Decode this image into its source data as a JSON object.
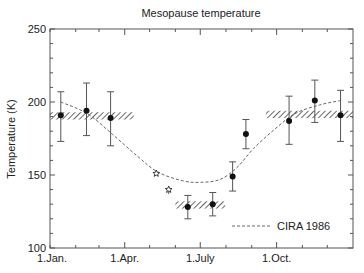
{
  "chart_data": {
    "type": "scatter",
    "title": "Mesopause temperature",
    "xlabel": "",
    "ylabel": "Temperature (K)",
    "ylim": [
      100,
      250
    ],
    "xlim": [
      0,
      365
    ],
    "yticks": [
      100,
      150,
      200,
      250
    ],
    "ytick_labels": [
      "100",
      "150",
      "200",
      "250"
    ],
    "xticks": [
      0,
      90,
      181,
      273
    ],
    "xtick_labels": [
      "1.Jan.",
      "1.Apr.",
      "1.July",
      "1.Oct."
    ],
    "grid": false,
    "legend": {
      "position": "lower right",
      "entries": [
        "CIRA 1986"
      ]
    },
    "series": [
      {
        "name": "Measurements",
        "marker": "filled-circle",
        "points": [
          {
            "day": 13,
            "value": 191,
            "low": 173,
            "high": 207
          },
          {
            "day": 44,
            "value": 194,
            "low": 177,
            "high": 213
          },
          {
            "day": 73,
            "value": 189,
            "low": 170,
            "high": 207
          },
          {
            "day": 166,
            "value": 128,
            "low": 120,
            "high": 136
          },
          {
            "day": 196,
            "value": 130,
            "low": 122,
            "high": 138
          },
          {
            "day": 220,
            "value": 149,
            "low": 139,
            "high": 159
          },
          {
            "day": 236,
            "value": 178,
            "low": 168,
            "high": 188
          },
          {
            "day": 288,
            "value": 187,
            "low": 171,
            "high": 204
          },
          {
            "day": 319,
            "value": 201,
            "low": 186,
            "high": 215
          },
          {
            "day": 350,
            "value": 191,
            "low": 173,
            "high": 208
          }
        ]
      },
      {
        "name": "Other measurements",
        "marker": "open-star",
        "points": [
          {
            "day": 128,
            "value": 151
          },
          {
            "day": 143,
            "value": 140,
            "low": 137,
            "high": 141
          }
        ]
      },
      {
        "name": "Hatched ranges",
        "type": "band",
        "bands": [
          {
            "day_start": 0,
            "day_end": 101,
            "low": 188,
            "high": 193
          },
          {
            "day_start": 151,
            "day_end": 211,
            "low": 127,
            "high": 132
          },
          {
            "day_start": 260,
            "day_end": 365,
            "low": 189,
            "high": 194
          }
        ]
      },
      {
        "name": "CIRA 1986",
        "type": "line",
        "style": "dashed",
        "points": [
          {
            "day": 13,
            "value": 200
          },
          {
            "day": 45,
            "value": 192
          },
          {
            "day": 75,
            "value": 178
          },
          {
            "day": 105,
            "value": 163
          },
          {
            "day": 130,
            "value": 152
          },
          {
            "day": 160,
            "value": 146
          },
          {
            "day": 182,
            "value": 145
          },
          {
            "day": 205,
            "value": 147
          },
          {
            "day": 225,
            "value": 155
          },
          {
            "day": 245,
            "value": 168
          },
          {
            "day": 270,
            "value": 181
          },
          {
            "day": 295,
            "value": 192
          },
          {
            "day": 325,
            "value": 198
          },
          {
            "day": 350,
            "value": 201
          }
        ]
      }
    ]
  },
  "colors": {
    "axis": "#555555",
    "marker": "#111111",
    "curve": "#666666",
    "text": "#222222"
  }
}
